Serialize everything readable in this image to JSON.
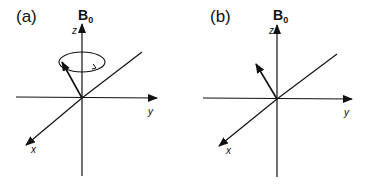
{
  "panels": [
    {
      "id": "a",
      "label": "(a)",
      "field_label": "B",
      "field_subscript": "0",
      "axes": {
        "z": "z",
        "y": "y",
        "x": "x"
      },
      "description": "Magnetization vector precessing about B0 (circular arrow)"
    },
    {
      "id": "b",
      "label": "(b)",
      "field_label": "B",
      "field_subscript": "0",
      "axes": {
        "z": "z",
        "y": "y",
        "x": "x"
      },
      "description": "Magnetization vector tilted from z-axis, no precession shown"
    }
  ],
  "colors": {
    "line": "#111111",
    "background": "#ffffff"
  }
}
